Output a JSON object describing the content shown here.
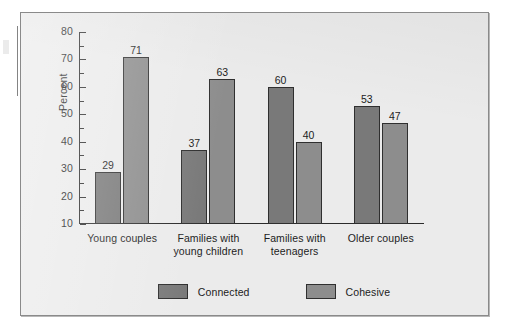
{
  "chart_data": {
    "type": "bar",
    "title": "",
    "xlabel": "",
    "ylabel": "Percent",
    "ylim": [
      10,
      80
    ],
    "y_major_ticks": [
      10,
      20,
      30,
      40,
      50,
      60,
      70,
      80
    ],
    "y_minor_ticks": [
      15,
      25,
      35,
      45,
      55,
      65,
      75
    ],
    "grid": false,
    "legend_position": "bottom-center",
    "categories": [
      "Young couples",
      "Families with\nyoung children",
      "Families with\nteenagers",
      "Older couples"
    ],
    "series": [
      {
        "name": "Connected",
        "color": "#797979",
        "values": [
          29,
          37,
          60,
          53
        ]
      },
      {
        "name": "Cohesive",
        "color": "#8d8d8d",
        "values": [
          71,
          63,
          40,
          47
        ]
      }
    ],
    "bar_value_labels": [
      [
        "29",
        "71"
      ],
      [
        "37",
        "63"
      ],
      [
        "60",
        "40"
      ],
      [
        "53",
        "47"
      ]
    ]
  },
  "legend": {
    "items": [
      {
        "label": "Connected"
      },
      {
        "label": "Cohesive"
      }
    ]
  },
  "axis": {
    "y_labels": [
      "80",
      "70",
      "60",
      "50",
      "40",
      "30",
      "20",
      "10"
    ],
    "y_title": "Percent"
  }
}
